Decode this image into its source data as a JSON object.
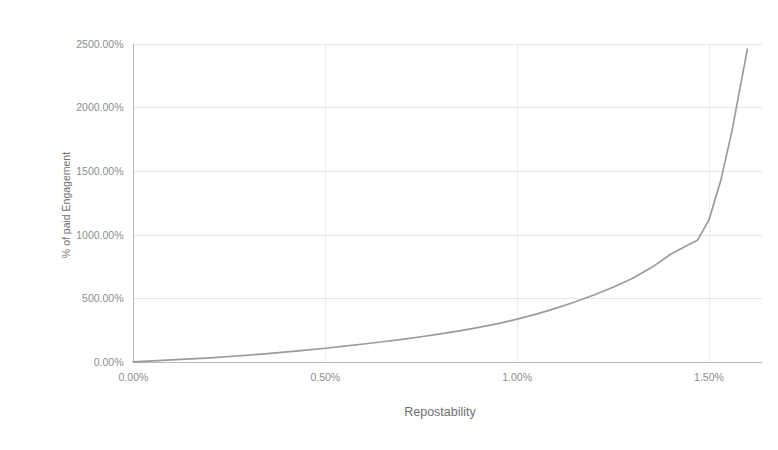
{
  "chart_data": {
    "type": "line",
    "title": "",
    "xlabel": "Repostability",
    "ylabel": "% of paid Engagement",
    "xlim": [
      0.0,
      1.6
    ],
    "ylim": [
      0,
      2500
    ],
    "grid": true,
    "legend": false,
    "legend_position": "none",
    "line_color": "#8a8a8a",
    "x_tick_labels": [
      "0.00%",
      "0.50%",
      "1.00%",
      "1.50%"
    ],
    "x_tick_values": [
      0.0,
      0.5,
      1.0,
      1.5
    ],
    "y_tick_labels": [
      "0.00%",
      "500.00%",
      "1000.00%",
      "1500.00%",
      "2000.00%",
      "2500.00%"
    ],
    "y_tick_values": [
      0,
      500,
      1000,
      1500,
      2000,
      2500
    ],
    "series": [
      {
        "name": "% of paid Engagement",
        "color": "#8a8a8a",
        "x": [
          0.0,
          0.05,
          0.1,
          0.15,
          0.2,
          0.25,
          0.3,
          0.35,
          0.4,
          0.45,
          0.5,
          0.55,
          0.6,
          0.65,
          0.7,
          0.75,
          0.8,
          0.85,
          0.9,
          0.95,
          1.0,
          1.05,
          1.1,
          1.15,
          1.2,
          1.25,
          1.3,
          1.35,
          1.4,
          1.45,
          1.47,
          1.5,
          1.53,
          1.56,
          1.6
        ],
        "y": [
          5,
          12,
          20,
          28,
          37,
          47,
          58,
          70,
          83,
          97,
          112,
          128,
          145,
          163,
          182,
          202,
          224,
          248,
          275,
          305,
          340,
          380,
          425,
          475,
          530,
          590,
          660,
          745,
          850,
          930,
          960,
          1120,
          1420,
          1820,
          2460
        ]
      }
    ]
  },
  "axes": {
    "x_title": "Repostability",
    "y_title": "% of paid Engagement"
  }
}
